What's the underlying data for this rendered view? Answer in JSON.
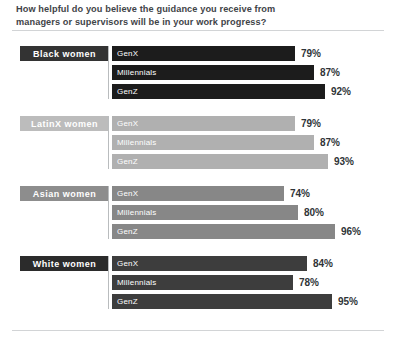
{
  "title": "How helpful do you believe the guidance you receive from managers or supervisors will be in your work progress?",
  "colors": {
    "text": "#3f4448",
    "value_text": "#2f3437",
    "rule": "#d2d4d6",
    "connector": "#b9bcbe",
    "black_women_chip": "#333333",
    "black_women_bar": "#1c1c1c",
    "latinx_women_chip": "#bcbcbc",
    "latinx_women_bar": "#b0b0b0",
    "asian_women_chip": "#8d8d8d",
    "asian_women_bar": "#878787",
    "white_women_chip": "#2b2b2b",
    "white_women_bar": "#3d3d3d"
  },
  "chart_data": {
    "type": "bar",
    "title": "How helpful do you believe the guidance you receive from managers or supervisors will be in your work progress?",
    "xlabel": "",
    "ylabel": "",
    "xlim": [
      0,
      100
    ],
    "grid": false,
    "legend": "none",
    "orientation": "horizontal",
    "unit": "%",
    "categories": [
      "GenX",
      "Millennials",
      "GenZ"
    ],
    "groups": [
      {
        "name": "Black women",
        "chip_color": "#333333",
        "bar_color": "#1c1c1c",
        "bars": [
          {
            "label": "GenX",
            "value": 79,
            "display": "79%"
          },
          {
            "label": "Millennials",
            "value": 87,
            "display": "87%"
          },
          {
            "label": "GenZ",
            "value": 92,
            "display": "92%"
          }
        ]
      },
      {
        "name": "LatinX women",
        "chip_color": "#bcbcbc",
        "bar_color": "#b0b0b0",
        "bars": [
          {
            "label": "GenX",
            "value": 79,
            "display": "79%"
          },
          {
            "label": "Millennials",
            "value": 87,
            "display": "87%"
          },
          {
            "label": "GenZ",
            "value": 93,
            "display": "93%"
          }
        ]
      },
      {
        "name": "Asian women",
        "chip_color": "#8d8d8d",
        "bar_color": "#878787",
        "bars": [
          {
            "label": "GenX",
            "value": 74,
            "display": "74%"
          },
          {
            "label": "Millennials",
            "value": 80,
            "display": "80%"
          },
          {
            "label": "GenZ",
            "value": 96,
            "display": "96%"
          }
        ]
      },
      {
        "name": "White women",
        "chip_color": "#2b2b2b",
        "bar_color": "#3d3d3d",
        "bars": [
          {
            "label": "GenX",
            "value": 84,
            "display": "84%"
          },
          {
            "label": "Millennials",
            "value": 78,
            "display": "78%"
          },
          {
            "label": "GenZ",
            "value": 95,
            "display": "95%"
          }
        ]
      }
    ]
  }
}
